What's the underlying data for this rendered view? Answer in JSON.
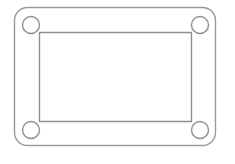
{
  "canvas": {
    "width": 235,
    "height": 164,
    "background_color": "#ffffff"
  },
  "drawing": {
    "title": "mounting-plate-outline",
    "description": "Technical line drawing of a rounded rectangular plate with an inset rectangular opening and four circular corner mounting holes.",
    "stroke_color": "#9a9a9a",
    "stroke_color_secondary": "#8f8f8f",
    "stroke_width": 1.4,
    "fill_color": "none",
    "outer_plate": {
      "name": "outer-rounded-rectangle",
      "x": 14.5,
      "y": 7.5,
      "width": 201,
      "height": 138,
      "corner_radius": 13
    },
    "inner_opening": {
      "name": "inner-rectangle",
      "x": 39.5,
      "y": 32.5,
      "width": 152,
      "height": 89,
      "corner_radius": 0
    },
    "holes": [
      {
        "name": "hole-top-left",
        "cx": 31,
        "cy": 25,
        "r": 8.5
      },
      {
        "name": "hole-top-right",
        "cx": 200,
        "cy": 25,
        "r": 8.5
      },
      {
        "name": "hole-bottom-left",
        "cx": 31,
        "cy": 130,
        "r": 8.5
      },
      {
        "name": "hole-bottom-right",
        "cx": 200,
        "cy": 130,
        "r": 8.5
      }
    ]
  }
}
